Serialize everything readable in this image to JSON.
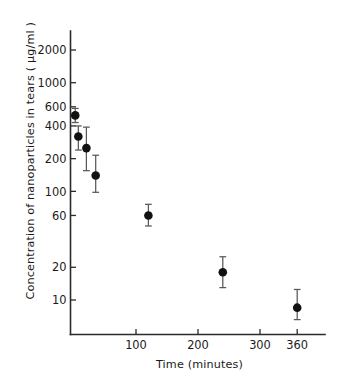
{
  "chart_data": {
    "type": "scatter",
    "title": "",
    "xlabel": "Time (minutes)",
    "ylabel": "Concentration of nanoparticles in tears  ( µg/ml )",
    "yscale": "log",
    "xscale": "linear",
    "xlim": [
      0,
      405
    ],
    "ylim": [
      6,
      2600
    ],
    "grid": false,
    "legend": null,
    "xticks": [
      100,
      200,
      300,
      360
    ],
    "xticklabels": [
      "100",
      "200",
      "300",
      "360"
    ],
    "yticks": [
      10,
      20,
      60,
      100,
      200,
      400,
      600,
      1000,
      2000
    ],
    "yticklabels": [
      "10",
      "20",
      "60",
      "100",
      "200",
      "400",
      "600",
      "1000",
      "2000"
    ],
    "series": [
      {
        "name": "Concentration of nanoparticles in tears",
        "marker": "circle",
        "marker_color": "#111111",
        "errorbar_color": "#585858",
        "points": [
          {
            "x": 2,
            "y": 500,
            "yerr_low": 430,
            "yerr_high": 580
          },
          {
            "x": 7,
            "y": 320,
            "yerr_low": 240,
            "yerr_high": 400
          },
          {
            "x": 20,
            "y": 250,
            "yerr_low": 155,
            "yerr_high": 390
          },
          {
            "x": 35,
            "y": 140,
            "yerr_low": 98,
            "yerr_high": 215
          },
          {
            "x": 120,
            "y": 60,
            "yerr_low": 48,
            "yerr_high": 76
          },
          {
            "x": 240,
            "y": 18,
            "yerr_low": 13,
            "yerr_high": 25
          },
          {
            "x": 360,
            "y": 8.5,
            "yerr_low": 6.6,
            "yerr_high": 12.5
          }
        ]
      }
    ]
  }
}
